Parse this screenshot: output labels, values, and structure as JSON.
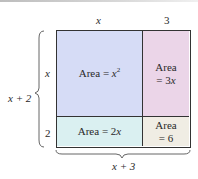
{
  "diagram": {
    "type": "area-model",
    "top_labels": {
      "left_column": "x",
      "right_column": "3"
    },
    "side_labels": {
      "top_row": "x",
      "bottom_row": "2",
      "total": "x + 2"
    },
    "bottom_label": "x + 3",
    "cells": [
      {
        "id": "top-left",
        "prefix": "Area = ",
        "var": "x",
        "sup": "2",
        "color": "#d6dcf6"
      },
      {
        "id": "top-right",
        "line1": "Area",
        "line2_prefix": "= 3",
        "line2_var": "x",
        "color": "#ebd5e8"
      },
      {
        "id": "bottom-left",
        "prefix": "Area = 2",
        "var": "x",
        "color": "#daf0f1"
      },
      {
        "id": "bottom-right",
        "line1": "Area",
        "line2": "= 6",
        "color": "#f0ede4"
      }
    ],
    "border_color": "#333333"
  }
}
